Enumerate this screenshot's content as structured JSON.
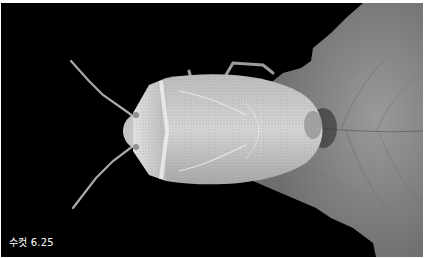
{
  "image": {
    "description": "Grayscale photograph of a stink bug (male) viewed from above, resting on a leaf against a black background",
    "subject": "stink bug",
    "background_color": "#000000",
    "leaf_color": "#8a8a8a",
    "bug_color": "#c8c8c8"
  },
  "caption": {
    "text": "수컷 6.25"
  }
}
